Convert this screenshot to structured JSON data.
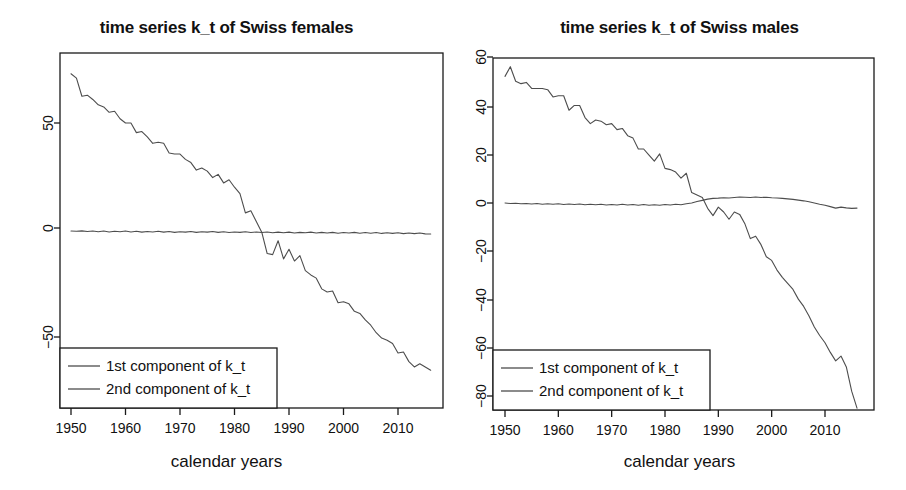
{
  "figure": {
    "background": "#ffffff",
    "line_color": "#4d4d4d",
    "axis_color": "#1a1a1a",
    "panel_count": 2
  },
  "panels": [
    {
      "id": "swiss-females",
      "title": "time series k_t of Swiss females",
      "xlabel": "calendar years",
      "legend": {
        "items": [
          "1st component of k_t",
          "2nd component of k_t"
        ]
      }
    },
    {
      "id": "swiss-males",
      "title": "time series k_t of Swiss males",
      "xlabel": "calendar years",
      "legend": {
        "items": [
          "1st component of k_t",
          "2nd component of k_t"
        ]
      }
    }
  ],
  "chart_data": [
    {
      "type": "line",
      "title": "time series k_t of Swiss females",
      "xlabel": "calendar years",
      "ylabel": "",
      "xlim": [
        1950,
        2016
      ],
      "ylim": [
        -70,
        75
      ],
      "xticks": [
        1950,
        1960,
        1970,
        1980,
        1990,
        2000,
        2010
      ],
      "yticks": [
        50,
        0,
        -50
      ],
      "grid": false,
      "legend_position": "bottom-left",
      "x": [
        1950,
        1951,
        1952,
        1953,
        1954,
        1955,
        1956,
        1957,
        1958,
        1959,
        1960,
        1961,
        1962,
        1963,
        1964,
        1965,
        1966,
        1967,
        1968,
        1969,
        1970,
        1971,
        1972,
        1973,
        1974,
        1975,
        1976,
        1977,
        1978,
        1979,
        1980,
        1981,
        1982,
        1983,
        1984,
        1985,
        1986,
        1987,
        1988,
        1989,
        1990,
        1991,
        1992,
        1993,
        1994,
        1995,
        1996,
        1997,
        1998,
        1999,
        2000,
        2001,
        2002,
        2003,
        2004,
        2005,
        2006,
        2007,
        2008,
        2009,
        2010,
        2011,
        2012,
        2013,
        2014,
        2015,
        2016
      ],
      "series": [
        {
          "name": "1st component of k_t",
          "values": [
            73.0,
            71.0,
            62.5,
            63.0,
            61.0,
            58.5,
            57.5,
            55.0,
            55.5,
            52.0,
            50.0,
            50.0,
            45.5,
            46.0,
            43.5,
            40.5,
            41.0,
            40.5,
            36.0,
            35.5,
            35.5,
            33.0,
            31.5,
            28.0,
            29.0,
            27.5,
            24.5,
            26.0,
            22.0,
            23.5,
            20.0,
            17.0,
            8.0,
            9.0,
            4.0,
            -1.0,
            -11.0,
            -11.5,
            -5.0,
            -13.5,
            -9.0,
            -14.5,
            -12.0,
            -19.0,
            -21.0,
            -22.5,
            -27.5,
            -29.0,
            -28.5,
            -34.0,
            -33.5,
            -34.5,
            -38.0,
            -39.0,
            -42.0,
            -44.5,
            -48.0,
            -50.5,
            -51.5,
            -53.0,
            -57.5,
            -57.0,
            -61.5,
            -64.0,
            -62.5,
            -64.0,
            -65.5
          ]
        },
        {
          "name": "2nd component of k_t",
          "values": [
            -0.5,
            -0.6,
            -0.4,
            -0.7,
            -0.5,
            -0.8,
            -0.5,
            -0.9,
            -0.6,
            -0.8,
            -0.5,
            -0.9,
            -0.6,
            -1.0,
            -0.7,
            -0.9,
            -0.6,
            -1.0,
            -0.7,
            -1.1,
            -0.8,
            -1.0,
            -0.7,
            -1.1,
            -0.8,
            -1.0,
            -0.7,
            -1.1,
            -0.8,
            -1.2,
            -0.9,
            -1.1,
            -0.8,
            -1.2,
            -0.9,
            -1.2,
            -0.9,
            -1.3,
            -1.0,
            -1.3,
            -1.0,
            -1.4,
            -1.1,
            -1.3,
            -1.0,
            -1.4,
            -1.1,
            -1.4,
            -1.1,
            -1.5,
            -1.2,
            -1.4,
            -1.1,
            -1.5,
            -1.2,
            -1.5,
            -1.2,
            -1.6,
            -1.3,
            -1.6,
            -1.3,
            -1.7,
            -1.4,
            -1.7,
            -1.4,
            -1.8,
            -1.9
          ]
        }
      ]
    },
    {
      "type": "line",
      "title": "time series k_t of Swiss males",
      "xlabel": "calendar years",
      "ylabel": "",
      "xlim": [
        1950,
        2016
      ],
      "ylim": [
        -88,
        62
      ],
      "xticks": [
        1950,
        1960,
        1970,
        1980,
        1990,
        2000,
        2010
      ],
      "yticks": [
        60,
        40,
        20,
        0,
        -20,
        -40,
        -60,
        -80
      ],
      "grid": false,
      "legend_position": "bottom-left",
      "x": [
        1950,
        1951,
        1952,
        1953,
        1954,
        1955,
        1956,
        1957,
        1958,
        1959,
        1960,
        1961,
        1962,
        1963,
        1964,
        1965,
        1966,
        1967,
        1968,
        1969,
        1970,
        1971,
        1972,
        1973,
        1974,
        1975,
        1976,
        1977,
        1978,
        1979,
        1980,
        1981,
        1982,
        1983,
        1984,
        1985,
        1986,
        1987,
        1988,
        1989,
        1990,
        1991,
        1992,
        1993,
        1994,
        1995,
        1996,
        1997,
        1998,
        1999,
        2000,
        2001,
        2002,
        2003,
        2004,
        2005,
        2006,
        2007,
        2008,
        2009,
        2010,
        2011,
        2012,
        2013,
        2014,
        2015,
        2016
      ],
      "series": [
        {
          "name": "1st component of k_t",
          "values": [
            52.0,
            56.0,
            50.0,
            49.0,
            49.5,
            47.0,
            47.0,
            47.0,
            46.5,
            43.5,
            44.0,
            44.0,
            38.0,
            40.0,
            40.0,
            35.0,
            32.5,
            34.0,
            33.5,
            32.0,
            32.5,
            30.0,
            30.5,
            27.5,
            26.5,
            22.0,
            22.0,
            19.5,
            17.0,
            20.0,
            14.0,
            13.5,
            12.5,
            10.0,
            12.0,
            4.0,
            3.0,
            2.0,
            -2.5,
            -5.5,
            -2.0,
            -4.0,
            -7.0,
            -4.0,
            -5.0,
            -9.0,
            -15.0,
            -14.0,
            -17.5,
            -22.5,
            -24.0,
            -28.0,
            -31.0,
            -33.5,
            -36.0,
            -40.0,
            -43.0,
            -47.0,
            -51.5,
            -55.0,
            -58.0,
            -62.0,
            -65.5,
            -63.5,
            -68.0,
            -78.0,
            -85.0
          ]
        },
        {
          "name": "2nd component of k_t",
          "values": [
            -0.3,
            -0.5,
            -0.4,
            -0.6,
            -0.5,
            -0.7,
            -0.5,
            -0.8,
            -0.6,
            -0.8,
            -0.6,
            -0.9,
            -0.7,
            -0.9,
            -0.7,
            -1.0,
            -0.8,
            -1.0,
            -0.8,
            -1.1,
            -0.9,
            -1.1,
            -0.8,
            -1.1,
            -0.9,
            -1.2,
            -0.9,
            -1.2,
            -1.0,
            -1.2,
            -0.9,
            -1.1,
            -0.8,
            -1.0,
            -0.6,
            -0.3,
            0.3,
            0.8,
            1.3,
            1.6,
            1.7,
            1.9,
            1.8,
            2.0,
            2.2,
            2.1,
            2.0,
            2.2,
            2.0,
            2.1,
            1.9,
            1.8,
            1.6,
            1.4,
            1.2,
            0.9,
            0.6,
            0.2,
            -0.3,
            -0.8,
            -1.2,
            -1.8,
            -2.4,
            -2.0,
            -2.3,
            -2.5,
            -2.4
          ]
        }
      ]
    }
  ]
}
